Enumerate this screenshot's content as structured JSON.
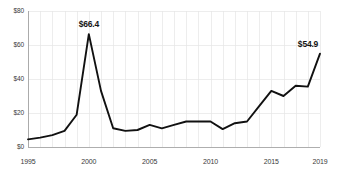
{
  "chart_data": {
    "type": "line",
    "title": "",
    "subtitle": "",
    "xlabel": "",
    "ylabel": "",
    "grid": true,
    "legend": null,
    "x": [
      1995,
      1996,
      1997,
      1998,
      1999,
      2000,
      2001,
      2002,
      2003,
      2004,
      2005,
      2006,
      2007,
      2008,
      2009,
      2010,
      2011,
      2012,
      2013,
      2014,
      2015,
      2016,
      2017,
      2018,
      2019
    ],
    "series": [
      {
        "name": "value",
        "values": [
          4.5,
          5.5,
          7.0,
          9.5,
          19.0,
          66.4,
          33.0,
          11.0,
          9.5,
          10.0,
          13.0,
          11.0,
          13.0,
          15.0,
          15.0,
          15.0,
          10.5,
          14.0,
          15.0,
          24.0,
          33.0,
          30.0,
          36.0,
          35.5,
          54.9
        ]
      }
    ],
    "xlim": [
      1995,
      2019
    ],
    "ylim": [
      0,
      80
    ],
    "yticks": [
      0,
      20,
      40,
      60,
      80
    ],
    "ytick_labels": [
      "$0",
      "$20",
      "$40",
      "$60",
      "$80"
    ],
    "xticks": [
      1995,
      2000,
      2005,
      2010,
      2015,
      2019
    ],
    "xtick_labels": [
      "1995",
      "2000",
      "2005",
      "2010",
      "2015",
      "2019"
    ],
    "annotations": [
      {
        "name": "peak-label",
        "text": "$66.4",
        "x": 2000,
        "y": 66.4
      },
      {
        "name": "end-label",
        "text": "$54.9",
        "x": 2019,
        "y": 54.9
      }
    ],
    "colors": {
      "line": "#111111",
      "grid": "#e6e6e6",
      "axis": "#9a9a9a",
      "background": "#ffffff",
      "tick_text": "#3a3a3a",
      "annotation_text": "#141414"
    }
  }
}
